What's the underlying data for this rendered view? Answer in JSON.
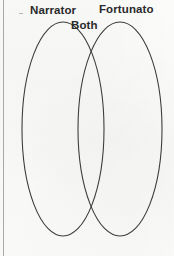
{
  "diagram": {
    "type": "venn",
    "title": "",
    "sets": [
      {
        "id": "left",
        "label": "Narrator",
        "cx": 63,
        "cy": 129,
        "rx": 41,
        "ry": 107
      },
      {
        "id": "right",
        "label": "Fortunato",
        "cx": 120,
        "cy": 129,
        "rx": 42,
        "ry": 107
      }
    ],
    "intersection": {
      "id": "both",
      "label": "Both"
    },
    "stroke_color": "#3d3d3d",
    "stroke_width": 1,
    "fill": "none",
    "background_color": "#fbfbfa",
    "border_color": "#a9a9a9"
  },
  "icons": {
    "ellipse_outline": "ellipse-outline-icon",
    "rule": "vertical-rule-icon"
  }
}
